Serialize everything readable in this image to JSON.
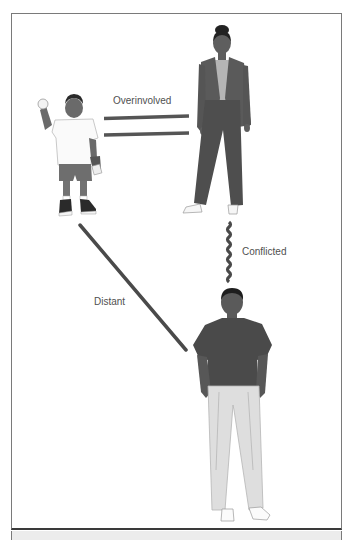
{
  "diagram": {
    "type": "family-relationship-diagram",
    "nodes": [
      {
        "id": "child",
        "role": "boy holding ball"
      },
      {
        "id": "mother",
        "role": "woman in suit"
      },
      {
        "id": "father",
        "role": "man in polo shirt"
      }
    ],
    "relationships": [
      {
        "from": "child",
        "to": "mother",
        "label": "Overinvolved",
        "line_style": "double"
      },
      {
        "from": "mother",
        "to": "father",
        "label": "Conflicted",
        "line_style": "zigzag"
      },
      {
        "from": "child",
        "to": "father",
        "label": "Distant",
        "line_style": "single"
      }
    ],
    "colors": {
      "line": "#4a4a4a",
      "frame": "#7a7a7a",
      "label": "#505050"
    }
  }
}
